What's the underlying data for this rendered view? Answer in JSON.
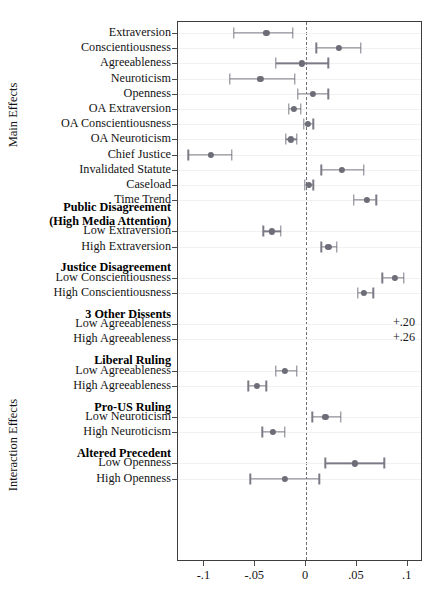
{
  "axis_captions": {
    "main": "Main Effects",
    "interaction": "Interaction Effects"
  },
  "chart_data": {
    "type": "scatter",
    "title": "",
    "xlabel": "",
    "ylabel": "",
    "xlim": [
      -0.125,
      -0.125
    ],
    "x_ticks": [
      -0.1,
      -0.05,
      0,
      0.05,
      0.1
    ],
    "x_tick_labels": [
      "-.1",
      "-.05",
      "0",
      ".05",
      ".1"
    ],
    "grid": false,
    "legend": "none",
    "reference_line": 0,
    "reference_line_style": "dashed",
    "marker": "point-with-95CI-whiskers",
    "axis_min": -0.126,
    "axis_max": 0.115,
    "groups": [
      {
        "caption": "Main Effects",
        "sections": [
          {
            "header": "",
            "rows": [
              {
                "label": "Extraversion",
                "estimate": -0.039,
                "lo": -0.071,
                "hi": -0.013
              },
              {
                "label": "Conscientiousness",
                "estimate": 0.032,
                "lo": 0.01,
                "hi": 0.054
              },
              {
                "label": "Agreeableness",
                "estimate": -0.004,
                "lo": -0.03,
                "hi": 0.022
              },
              {
                "label": "Neuroticism",
                "estimate": -0.045,
                "lo": -0.075,
                "hi": -0.011
              },
              {
                "label": "Openness",
                "estimate": 0.007,
                "lo": -0.008,
                "hi": 0.022
              },
              {
                "label": "OA Extraversion",
                "estimate": -0.012,
                "lo": -0.017,
                "hi": -0.005
              },
              {
                "label": "OA Conscientiousness",
                "estimate": 0.002,
                "lo": -0.002,
                "hi": 0.007
              },
              {
                "label": "OA Neuroticism",
                "estimate": -0.015,
                "lo": -0.02,
                "hi": -0.009
              },
              {
                "label": "Chief Justice",
                "estimate": -0.094,
                "lo": -0.116,
                "hi": -0.073
              },
              {
                "label": "Invalidated Statute",
                "estimate": 0.035,
                "lo": 0.015,
                "hi": 0.057
              },
              {
                "label": "Caseload",
                "estimate": 0.003,
                "lo": -0.001,
                "hi": 0.007
              },
              {
                "label": "Time Trend",
                "estimate": 0.06,
                "lo": 0.047,
                "hi": 0.069
              }
            ]
          }
        ]
      },
      {
        "caption": "Interaction Effects",
        "sections": [
          {
            "header": "Public Disagreement\n(High Media Attention)",
            "header_lines": [
              "Public Disagreement",
              "(High Media Attention)"
            ],
            "rows": [
              {
                "label": "Low Extraversion",
                "estimate": -0.034,
                "lo": -0.042,
                "hi": -0.025
              },
              {
                "label": "High Extraversion",
                "estimate": 0.022,
                "lo": 0.015,
                "hi": 0.03
              }
            ]
          },
          {
            "header": "Justice Disagreement",
            "header_lines": [
              "Justice Disagreement"
            ],
            "rows": [
              {
                "label": "Low Conscientiousness",
                "estimate": 0.087,
                "lo": 0.075,
                "hi": 0.096
              },
              {
                "label": "High Conscientiousness",
                "estimate": 0.057,
                "lo": 0.051,
                "hi": 0.066
              }
            ]
          },
          {
            "header": "3 Other Dissents",
            "header_lines": [
              "3 Other Dissents"
            ],
            "rows": [
              {
                "label": "Low Agreeableness",
                "estimate": 0.2,
                "lo": null,
                "hi": null,
                "offscale_label": "+.20"
              },
              {
                "label": "High Agreeableness",
                "estimate": 0.26,
                "lo": null,
                "hi": null,
                "offscale_label": "+.26"
              }
            ]
          },
          {
            "header": "Liberal Ruling",
            "header_lines": [
              "Liberal Ruling"
            ],
            "rows": [
              {
                "label": "Low Agreeableness",
                "estimate": -0.021,
                "lo": -0.03,
                "hi": -0.009
              },
              {
                "label": "High Agreeableness",
                "estimate": -0.048,
                "lo": -0.057,
                "hi": -0.039
              }
            ]
          },
          {
            "header": "Pro-US Ruling",
            "header_lines": [
              "Pro-US Ruling"
            ],
            "rows": [
              {
                "label": "Low Neuroticism",
                "estimate": 0.019,
                "lo": 0.006,
                "hi": 0.034
              },
              {
                "label": "High Neuroticism",
                "estimate": -0.033,
                "lo": -0.043,
                "hi": -0.021
              }
            ]
          },
          {
            "header": "Altered Precedent",
            "header_lines": [
              "Altered Precedent"
            ],
            "rows": [
              {
                "label": "Low Openness",
                "estimate": 0.048,
                "lo": 0.019,
                "hi": 0.077
              },
              {
                "label": "High Openness",
                "estimate": -0.021,
                "lo": -0.055,
                "hi": 0.013
              }
            ]
          }
        ]
      }
    ]
  },
  "colors": {
    "marker": "#6d6d78",
    "interval": "#7b7b86",
    "frame": "#3d3d3d",
    "zero_line": "#6f6f78"
  }
}
